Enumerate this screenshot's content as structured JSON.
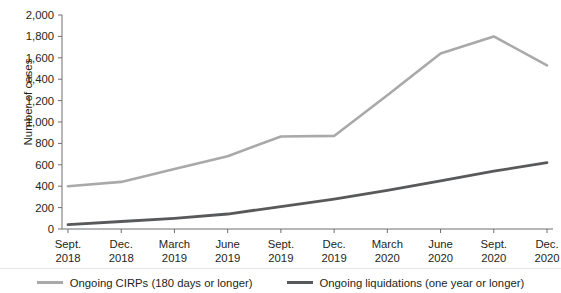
{
  "chart_data": {
    "type": "line",
    "title": "",
    "xlabel": "",
    "ylabel": "Number of cases",
    "ylim": [
      0,
      2000
    ],
    "ytick_step": 200,
    "grid": false,
    "legend_position": "bottom",
    "categories": [
      "Sept.\n2018",
      "Dec.\n2018",
      "March\n2019",
      "June\n2019",
      "Sept.\n2019",
      "Dec.\n2019",
      "March\n2020",
      "June\n2020",
      "Sept.\n2020",
      "Dec.\n2020"
    ],
    "category_lines": [
      [
        "Sept.",
        "2018"
      ],
      [
        "Dec.",
        "2018"
      ],
      [
        "March",
        "2019"
      ],
      [
        "June",
        "2019"
      ],
      [
        "Sept.",
        "2019"
      ],
      [
        "Dec.",
        "2019"
      ],
      [
        "March",
        "2020"
      ],
      [
        "June",
        "2020"
      ],
      [
        "Sept.",
        "2020"
      ],
      [
        "Dec.",
        "2020"
      ]
    ],
    "ytick_labels": [
      "2,000",
      "1,800",
      "1,600",
      "1,400",
      "1,200",
      "1,000",
      "800",
      "600",
      "400",
      "200",
      "0"
    ],
    "ytick_values": [
      2000,
      1800,
      1600,
      1400,
      1200,
      1000,
      800,
      600,
      400,
      200,
      0
    ],
    "series": [
      {
        "name": "Ongoing CIRPs (180 days or longer)",
        "color": "#a9a9a9",
        "values": [
          400,
          440,
          560,
          680,
          865,
          870,
          1250,
          1640,
          1800,
          1530
        ]
      },
      {
        "name": "Ongoing liquidations (one year or longer)",
        "color": "#58595b",
        "values": [
          40,
          70,
          100,
          140,
          210,
          280,
          360,
          450,
          540,
          620
        ]
      }
    ]
  },
  "legend": {
    "items": [
      {
        "label": "Ongoing CIRPs (180 days or longer)",
        "color": "#a9a9a9"
      },
      {
        "label": "Ongoing liquidations (one year or longer)",
        "color": "#58595b"
      }
    ]
  },
  "axis": {
    "y_title": "Number of cases"
  }
}
